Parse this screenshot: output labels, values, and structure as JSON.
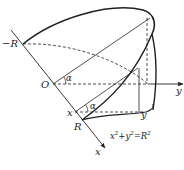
{
  "figure": {
    "labels": {
      "neg_r": "−R",
      "origin": "O",
      "alpha_top": "α",
      "alpha_bottom": "α",
      "x_point": "x",
      "r_point": "R",
      "y_point": "y",
      "y_axis": "y",
      "x_axis": "x",
      "equation_lhs": "x",
      "equation_mid": "+y",
      "equation_rhs": "=R",
      "exp": "2"
    },
    "colors": {
      "stroke": "#222222",
      "background": "#ffffff"
    }
  }
}
